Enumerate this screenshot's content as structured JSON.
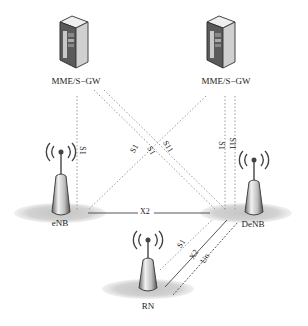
{
  "diagram": {
    "nodes": {
      "mme_left": {
        "label": "MME/S−GW",
        "type": "server"
      },
      "mme_right": {
        "label": "MME/S−GW",
        "type": "server"
      },
      "enb": {
        "label": "eNB",
        "type": "base-station"
      },
      "denb": {
        "label": "DeNB",
        "type": "base-station"
      },
      "rn": {
        "label": "RN",
        "type": "relay-node"
      }
    },
    "links": [
      {
        "from": "mme_left",
        "to": "enb",
        "label": "S1",
        "style": "dotted"
      },
      {
        "from": "mme_left",
        "to": "denb",
        "label": "S1",
        "style": "dotted"
      },
      {
        "from": "mme_left",
        "to": "denb",
        "label": "S11",
        "style": "dotted"
      },
      {
        "from": "mme_right",
        "to": "enb",
        "label": "S1",
        "style": "dotted"
      },
      {
        "from": "mme_right",
        "to": "denb",
        "label": "S1",
        "style": "dotted"
      },
      {
        "from": "mme_right",
        "to": "denb",
        "label": "S11",
        "style": "dotted"
      },
      {
        "from": "enb",
        "to": "denb",
        "label": "X2",
        "style": "solid"
      },
      {
        "from": "rn",
        "to": "denb",
        "label": "S1",
        "style": "dotted"
      },
      {
        "from": "rn",
        "to": "denb",
        "label": "X2",
        "style": "solid"
      },
      {
        "from": "rn",
        "to": "denb",
        "label": "Un",
        "style": "dashed"
      }
    ],
    "colors": {
      "line": "#555555",
      "dotted": "#9a9a9a",
      "coverage": "#cfcfcf",
      "server_body": "#d8d8d8",
      "server_dark": "#4a4a4a"
    }
  }
}
